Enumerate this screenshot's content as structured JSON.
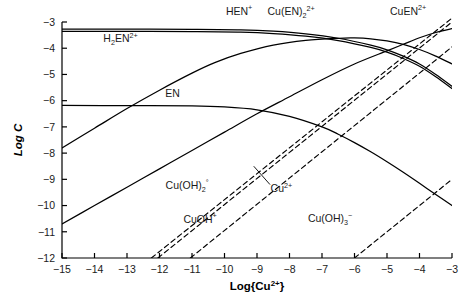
{
  "chart_data": {
    "type": "line",
    "title": "",
    "xlabel": "Log{Cu2+}",
    "xlabel_parts": {
      "base": "Log{Cu",
      "sup": "2+",
      "tail": "}"
    },
    "ylabel": "Log C",
    "xlim": [
      -15,
      -3
    ],
    "ylim": [
      -12,
      -3
    ],
    "xticks": [
      "-15",
      "-14",
      "-13",
      "-12",
      "-11",
      "-10",
      "-9",
      "-8",
      "-7",
      "-6",
      "-5",
      "-4",
      "-3"
    ],
    "yticks": [
      "-3",
      "-4",
      "-5",
      "-6",
      "-7",
      "-8",
      "-9",
      "-10",
      "-11",
      "-12"
    ],
    "grid": false,
    "legend": "inline-labels",
    "series": [
      {
        "name": "HEN+",
        "label_parts": {
          "base": "HEN",
          "sup": "+"
        },
        "style": "solid",
        "label_x": -9.55,
        "label_y": -2.72,
        "points": [
          [
            -15,
            -3.27
          ],
          [
            -13,
            -3.27
          ],
          [
            -11,
            -3.28
          ],
          [
            -9.5,
            -3.3
          ],
          [
            -8.5,
            -3.35
          ],
          [
            -7.5,
            -3.45
          ],
          [
            -6.5,
            -3.62
          ],
          [
            -5.5,
            -3.88
          ],
          [
            -5,
            -4.06
          ],
          [
            -4.5,
            -4.3
          ],
          [
            -4,
            -4.6
          ],
          [
            -3.5,
            -5.0
          ],
          [
            -3,
            -5.45
          ]
        ]
      },
      {
        "name": "H2EN2+",
        "label_parts": {
          "base": "H",
          "sub": "2",
          "mid": "EN",
          "sup": "2+"
        },
        "style": "solid",
        "label_x": -13.2,
        "label_y": -3.78,
        "points": [
          [
            -15,
            -3.36
          ],
          [
            -13,
            -3.36
          ],
          [
            -11,
            -3.37
          ],
          [
            -9.5,
            -3.39
          ],
          [
            -8.5,
            -3.44
          ],
          [
            -7.5,
            -3.54
          ],
          [
            -6.5,
            -3.71
          ],
          [
            -5.5,
            -3.97
          ],
          [
            -5,
            -4.15
          ],
          [
            -4.5,
            -4.39
          ],
          [
            -4,
            -4.69
          ],
          [
            -3.5,
            -5.09
          ],
          [
            -3,
            -5.54
          ]
        ]
      },
      {
        "name": "EN",
        "label_parts": {
          "base": "EN"
        },
        "style": "solid",
        "label_x": -11.6,
        "label_y": -5.85,
        "points": [
          [
            -15,
            -6.18
          ],
          [
            -13,
            -6.19
          ],
          [
            -11,
            -6.2
          ],
          [
            -10,
            -6.24
          ],
          [
            -9,
            -6.35
          ],
          [
            -8,
            -6.6
          ],
          [
            -7,
            -7.0
          ],
          [
            -6.5,
            -7.28
          ],
          [
            -6,
            -7.6
          ],
          [
            -5.5,
            -7.95
          ],
          [
            -5,
            -8.33
          ],
          [
            -4.5,
            -8.73
          ],
          [
            -4,
            -9.15
          ],
          [
            -3.5,
            -9.58
          ],
          [
            -3,
            -10.0
          ]
        ]
      },
      {
        "name": "Cu(EN)2 2+",
        "label_parts": {
          "base": "Cu(EN)",
          "sub": "2",
          "sup": "2+"
        },
        "style": "solid",
        "label_x": -7.95,
        "label_y": -2.72,
        "points": [
          [
            -15,
            -10.7
          ],
          [
            -14,
            -10.0
          ],
          [
            -13,
            -9.3
          ],
          [
            -12,
            -8.6
          ],
          [
            -11,
            -7.9
          ],
          [
            -10,
            -7.2
          ],
          [
            -9,
            -6.5
          ],
          [
            -8,
            -5.85
          ],
          [
            -7,
            -5.2
          ],
          [
            -6,
            -4.6
          ],
          [
            -5,
            -4.1
          ],
          [
            -4.5,
            -3.85
          ],
          [
            -4,
            -3.6
          ],
          [
            -3.5,
            -3.4
          ],
          [
            -3,
            -3.25
          ]
        ]
      },
      {
        "name": "CuEN2+",
        "label_parts": {
          "base": "CuEN",
          "sup": "2+"
        },
        "style": "solid",
        "label_x": -4.35,
        "label_y": -2.72,
        "points": [
          [
            -15,
            -7.8
          ],
          [
            -14,
            -7.05
          ],
          [
            -13,
            -6.3
          ],
          [
            -12,
            -5.6
          ],
          [
            -11,
            -4.95
          ],
          [
            -10.3,
            -4.55
          ],
          [
            -9.5,
            -4.2
          ],
          [
            -8.5,
            -3.88
          ],
          [
            -7.5,
            -3.7
          ],
          [
            -6.5,
            -3.62
          ],
          [
            -6,
            -3.61
          ],
          [
            -5.5,
            -3.64
          ],
          [
            -5,
            -3.72
          ],
          [
            -4.5,
            -3.85
          ],
          [
            -4,
            -4.05
          ],
          [
            -3.5,
            -4.3
          ],
          [
            -3,
            -4.6
          ]
        ]
      },
      {
        "name": "Cu(OH)2 0",
        "label_parts": {
          "base": "Cu(OH)",
          "sub": "2",
          "sup": "°"
        },
        "style": "dashed",
        "label_x": -11.15,
        "label_y": -9.35,
        "points": [
          [
            -12.25,
            -12.0
          ],
          [
            -3.0,
            -2.85
          ]
        ]
      },
      {
        "name": "Cu2+",
        "label_parts": {
          "base": "Cu",
          "sup": "2+"
        },
        "style": "dashed",
        "label_x": -8.25,
        "label_y": -9.5,
        "points": [
          [
            -12.05,
            -12.0
          ],
          [
            -3.0,
            -3.0
          ]
        ]
      },
      {
        "name": "CuOH+",
        "label_parts": {
          "base": "CuOH",
          "sup": "+"
        },
        "style": "dashed",
        "label_x": -10.75,
        "label_y": -10.65,
        "points": [
          [
            -11.05,
            -12.0
          ],
          [
            -3.0,
            -3.95
          ]
        ]
      },
      {
        "name": "Cu(OH)3-",
        "label_parts": {
          "base": "Cu(OH)",
          "sub": "3",
          "sup": "−"
        },
        "style": "dashed",
        "label_x": -6.75,
        "label_y": -10.62,
        "points": [
          [
            -6.0,
            -12.0
          ],
          [
            -3.0,
            -9.0
          ]
        ]
      }
    ],
    "leader_lines": [
      {
        "name": "cu2plus-leader",
        "from_x": -8.6,
        "from_y": -9.2,
        "to_x": -9.1,
        "to_y": -8.5
      }
    ]
  }
}
